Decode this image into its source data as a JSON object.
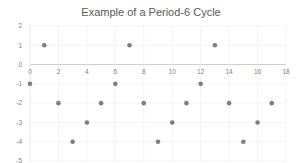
{
  "chart_data": {
    "type": "scatter",
    "title": "Example of a Period-6 Cycle",
    "xlabel": "",
    "ylabel": "",
    "xlim": [
      0,
      18
    ],
    "ylim": [
      -5,
      2
    ],
    "x_ticks": [
      0,
      2,
      4,
      6,
      8,
      10,
      12,
      14,
      16,
      18
    ],
    "y_ticks": [
      2,
      1,
      0,
      -1,
      -2,
      -3,
      -4,
      -5
    ],
    "grid": true,
    "legend": "none",
    "marker_color": "#7f7f7f",
    "series": [
      {
        "name": "Series1",
        "x": [
          0,
          1,
          2,
          3,
          4,
          5,
          6,
          7,
          8,
          9,
          10,
          11,
          12,
          13,
          14,
          15,
          16,
          17
        ],
        "values": [
          -1,
          1,
          -2,
          -4,
          -3,
          -2,
          -1,
          1,
          -2,
          -4,
          -3,
          -2,
          -1,
          1,
          -2,
          -4,
          -3,
          -2
        ]
      }
    ]
  }
}
